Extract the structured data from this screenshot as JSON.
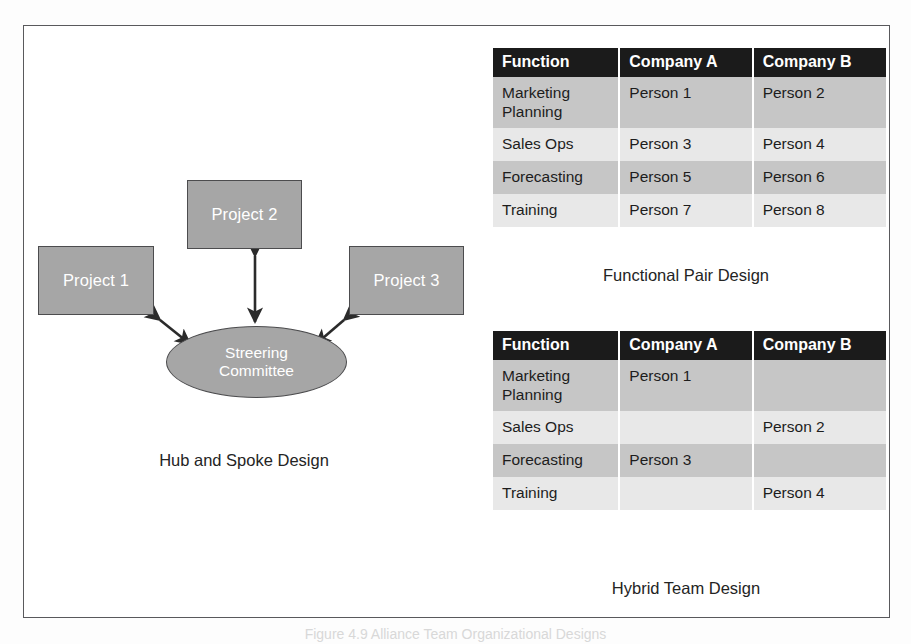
{
  "figure": {
    "bottom_label": "Figure 4.9  Alliance Team Organizational Designs"
  },
  "hub_spoke": {
    "caption": "Hub and Spoke Design",
    "hub": {
      "line1": "Streering",
      "line2": "Committee"
    },
    "spokes": [
      {
        "label": "Project 1"
      },
      {
        "label": "Project 2"
      },
      {
        "label": "Project 3"
      }
    ]
  },
  "tables": [
    {
      "id": "functional-pair",
      "caption": "Functional Pair Design",
      "headers": [
        "Function",
        "Company A",
        "Company B"
      ],
      "rows": [
        {
          "function": "Marketing\nPlanning",
          "company_a": "Person 1",
          "company_b": "Person 2"
        },
        {
          "function": "Sales Ops",
          "company_a": "Person 3",
          "company_b": "Person 4"
        },
        {
          "function": "Forecasting",
          "company_a": "Person 5",
          "company_b": "Person 6"
        },
        {
          "function": "Training",
          "company_a": "Person 7",
          "company_b": "Person 8"
        }
      ]
    },
    {
      "id": "hybrid-team",
      "caption": "Hybrid Team Design",
      "headers": [
        "Function",
        "Company A",
        "Company B"
      ],
      "rows": [
        {
          "function": "Marketing\nPlanning",
          "company_a": "Person 1",
          "company_b": ""
        },
        {
          "function": "Sales Ops",
          "company_a": "",
          "company_b": "Person 2"
        },
        {
          "function": "Forecasting",
          "company_a": "Person 3",
          "company_b": ""
        },
        {
          "function": "Training",
          "company_a": "",
          "company_b": "Person 4"
        }
      ]
    }
  ],
  "colors": {
    "node_fill": "#a6a6a6",
    "node_border": "#4c4c4e",
    "header_bg": "#1b1b1b",
    "row_dark": "#c6c6c6",
    "row_light": "#e8e8e8",
    "frame_border": "#59595c"
  }
}
